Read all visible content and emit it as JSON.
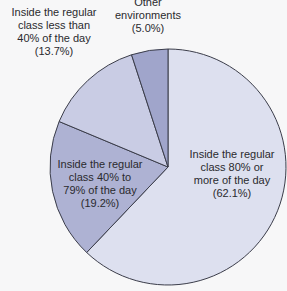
{
  "chart_data": {
    "type": "pie",
    "title": "",
    "start_angle_deg": 0,
    "direction": "clockwise",
    "slices": [
      {
        "label": "Inside the regular class 80% or more of the day",
        "value": 62.1,
        "display": "(62.1%)",
        "color": "#dde0ef"
      },
      {
        "label": "Inside the regular class 40% to 79% of the day",
        "value": 19.2,
        "display": "(19.2%)",
        "color": "#aeb2d3"
      },
      {
        "label": "Inside the regular class less than 40% of the day",
        "value": 13.7,
        "display": "(13.7%)",
        "color": "#c9cce4"
      },
      {
        "label": "Other environments",
        "value": 5.0,
        "display": "(5.0%)",
        "color": "#a0a5cb"
      }
    ]
  },
  "labels": {
    "s80": [
      "Inside the regular",
      "class 80% or",
      "more of the day",
      "(62.1%)"
    ],
    "s40": [
      "Inside the regular",
      "class 40% to",
      "79% of the day",
      "(19.2%)"
    ],
    "sless": [
      "Inside the regular",
      "class less than",
      "40% of the day",
      "(13.7%)"
    ],
    "other": [
      "Other",
      "environments",
      "(5.0%)"
    ]
  }
}
